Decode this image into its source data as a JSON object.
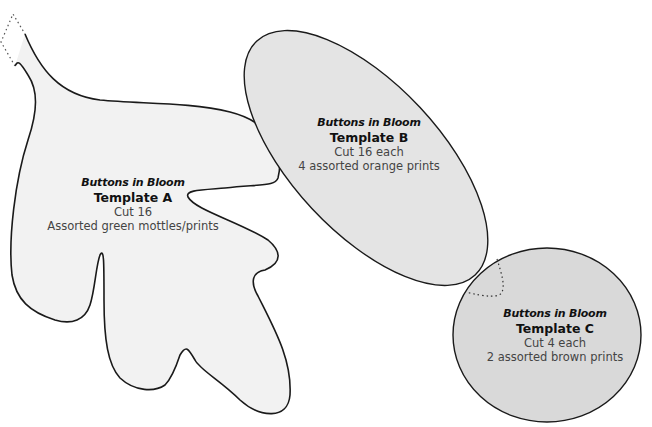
{
  "colors": {
    "leaf_fill": "#f2f2f2",
    "ellipse_fill": "#e4e4e4",
    "circle_fill": "#d9d9d9",
    "outline": "#1a1a1a"
  },
  "templates": [
    {
      "series": "Buttons in Bloom",
      "name": "Template A",
      "cut": "Cut 16",
      "fabric": "Assorted green mottles/prints",
      "shape": "oak-leaf"
    },
    {
      "series": "Buttons in Bloom",
      "name": "Template B",
      "cut": "Cut 16 each",
      "fabric": "4 assorted orange prints",
      "shape": "ellipse"
    },
    {
      "series": "Buttons in Bloom",
      "name": "Template C",
      "cut": "Cut 4 each",
      "fabric": "2 assorted brown prints",
      "shape": "circle"
    }
  ]
}
